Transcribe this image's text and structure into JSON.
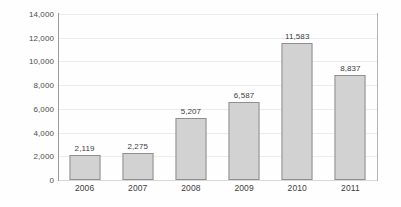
{
  "chart_data": {
    "type": "bar",
    "title": "",
    "xlabel": "",
    "ylabel": "",
    "categories": [
      "2006",
      "2007",
      "2008",
      "2009",
      "2010",
      "2011"
    ],
    "values": [
      2119,
      2275,
      5207,
      6587,
      11583,
      8837
    ],
    "data_labels": [
      "2,119",
      "2,275",
      "5,207",
      "6,587",
      "11,583",
      "8,837"
    ],
    "ylim": [
      0,
      14000
    ],
    "ytick_values": [
      0,
      2000,
      4000,
      6000,
      8000,
      10000,
      12000,
      14000
    ],
    "ytick_labels": [
      "0",
      "2,000",
      "4,000",
      "6,000",
      "8,000",
      "10,000",
      "12,000",
      "14,000"
    ],
    "grid": true,
    "grid_axis": "y",
    "legend": false,
    "legend_position": "none",
    "bar_fill_color": "#d2d2d2",
    "bar_border_color": "#8f8f8f",
    "gridline_color": "#ececec",
    "axis_line_color": "#9a9a9a",
    "text_color": "#3d3d3d",
    "background_color": "#fefefe"
  }
}
